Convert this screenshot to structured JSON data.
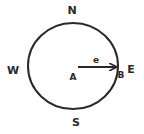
{
  "diagram": {
    "directions": {
      "north": "N",
      "south": "S",
      "east": "E",
      "west": "W"
    },
    "points": {
      "center": "A",
      "edge": "B"
    },
    "vector_label": "e",
    "colors": {
      "stroke": "#2a2a2a",
      "background": "#ffffff"
    }
  }
}
